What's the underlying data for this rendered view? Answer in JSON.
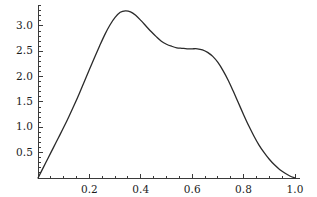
{
  "chart_data": {
    "type": "line",
    "title": "",
    "subtitle": "",
    "xlabel": "",
    "ylabel": "",
    "xlim": [
      0.0,
      1.0
    ],
    "ylim": [
      0.0,
      3.4
    ],
    "grid": false,
    "legend": null,
    "legend_position": "none",
    "axis_ranges_drawn": {
      "x_axis_from": 0.0,
      "x_axis_to": 1.02,
      "y_axis_from": 0.0,
      "y_axis_to": 3.4
    },
    "xticks": [
      0.2,
      0.4,
      0.6,
      0.8,
      1.0
    ],
    "xtick_labels": [
      "0.2",
      "0.4",
      "0.6",
      "0.8",
      "1.0"
    ],
    "x_minor_tick_step": 0.05,
    "yticks": [
      0.5,
      1.0,
      1.5,
      2.0,
      2.5,
      3.0
    ],
    "ytick_labels": [
      "0.5",
      "1.0",
      "1.5",
      "2.0",
      "2.5",
      "3.0"
    ],
    "y_minor_tick_step": 0.1,
    "series": [
      {
        "name": "density",
        "color": "#2a2a2a",
        "linewidth": 1.3,
        "x": [
          0.0,
          0.02,
          0.04,
          0.06,
          0.08,
          0.1,
          0.12,
          0.14,
          0.16,
          0.18,
          0.2,
          0.22,
          0.24,
          0.26,
          0.28,
          0.3,
          0.32,
          0.34,
          0.36,
          0.38,
          0.4,
          0.42,
          0.44,
          0.46,
          0.48,
          0.5,
          0.52,
          0.54,
          0.56,
          0.58,
          0.6,
          0.62,
          0.64,
          0.66,
          0.68,
          0.7,
          0.72,
          0.74,
          0.76,
          0.78,
          0.8,
          0.82,
          0.84,
          0.86,
          0.88,
          0.9,
          0.92,
          0.94,
          0.96,
          0.98,
          1.0
        ],
        "y": [
          0.0,
          0.2,
          0.4,
          0.6,
          0.8,
          1.0,
          1.21,
          1.43,
          1.66,
          1.9,
          2.14,
          2.38,
          2.61,
          2.83,
          3.02,
          3.17,
          3.27,
          3.3,
          3.28,
          3.21,
          3.11,
          3.0,
          2.89,
          2.79,
          2.7,
          2.64,
          2.6,
          2.57,
          2.56,
          2.55,
          2.55,
          2.55,
          2.53,
          2.48,
          2.4,
          2.28,
          2.12,
          1.93,
          1.71,
          1.48,
          1.25,
          1.03,
          0.83,
          0.65,
          0.5,
          0.37,
          0.26,
          0.17,
          0.1,
          0.04,
          0.0
        ],
        "peak": {
          "x": 0.34,
          "y": 3.3
        },
        "shoulder": {
          "x_range": [
            0.56,
            0.63
          ],
          "y": 2.55
        },
        "endpoints": [
          {
            "x": 0.0,
            "y": 0.0
          },
          {
            "x": 1.0,
            "y": 0.0
          }
        ]
      }
    ],
    "annotations": [],
    "colors": {
      "curve": "#2a2a2a",
      "axis": "#3a3a3a",
      "tick": "#3a3a3a",
      "background": "#ffffff",
      "label": "#1c1c1c"
    }
  }
}
